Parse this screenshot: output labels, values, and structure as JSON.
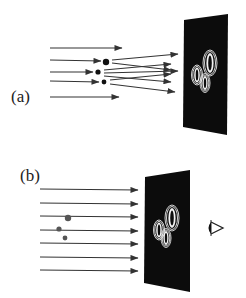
{
  "figure": {
    "panels": [
      {
        "id": "a",
        "label": "(a)",
        "caption_role": "recording: reference beam plus object-scattered waves interfere at plate",
        "parallel_rays_y": [
          48,
          97
        ],
        "scattering_objects": [
          {
            "x": 106,
            "y": 62,
            "r": 3.2
          },
          {
            "x": 98,
            "y": 72,
            "r": 2.6
          },
          {
            "x": 104,
            "y": 82,
            "r": 2.4
          }
        ],
        "plate": {
          "points": "184,20 228,14 227,135 183,127",
          "color": "#0c0c0c"
        },
        "fringe_patterns": [
          {
            "cx": 210,
            "cy": 63,
            "rx": 3.2,
            "ry": 10
          },
          {
            "cx": 197,
            "cy": 75,
            "rx": 2.4,
            "ry": 7
          },
          {
            "cx": 205,
            "cy": 83,
            "rx": 2.4,
            "ry": 7
          }
        ]
      },
      {
        "id": "b",
        "label": "(b)",
        "caption_role": "reconstruction: illuminating hologram, viewer sees virtual objects",
        "parallel_rays_y": [
          189,
          203,
          216,
          230,
          243,
          257,
          270
        ],
        "virtual_objects": [
          {
            "x": 68,
            "y": 218,
            "r": 3.2
          },
          {
            "x": 59,
            "y": 229,
            "r": 2.6
          },
          {
            "x": 65,
            "y": 238,
            "r": 2.4
          }
        ],
        "plate": {
          "points": "145,177 190,170 190,292 144,283",
          "color": "#0c0c0c"
        },
        "fringe_patterns": [
          {
            "cx": 172,
            "cy": 218,
            "rx": 3.2,
            "ry": 10
          },
          {
            "cx": 159,
            "cy": 230,
            "rx": 2.4,
            "ry": 7
          },
          {
            "cx": 166,
            "cy": 238,
            "rx": 2.4,
            "ry": 7
          }
        ],
        "observer": {
          "icon": "eye-icon",
          "x": 213,
          "y": 228
        }
      }
    ]
  },
  "colors": {
    "background": "#ffffff",
    "ray": "#333333",
    "plate": "#0c0c0c",
    "fringe": "#e8e8e8",
    "object": "#111111",
    "virtual_object": "#555555"
  }
}
